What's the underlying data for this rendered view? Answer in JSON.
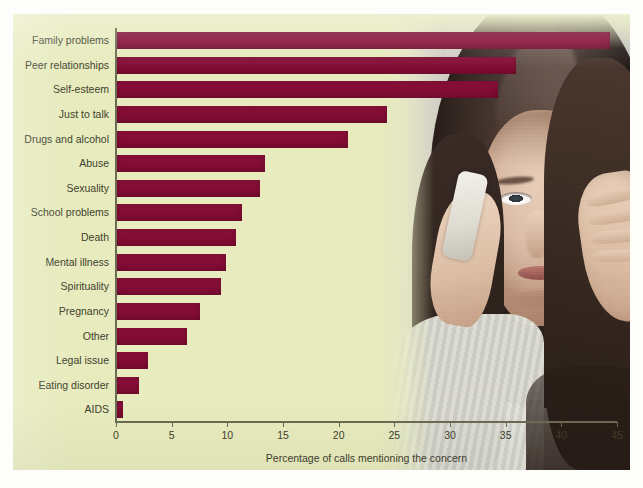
{
  "chart_data": {
    "type": "bar",
    "orientation": "horizontal",
    "title": "",
    "xlabel": "Percentage of calls mentioning the concern",
    "ylabel": "",
    "xlim": [
      0,
      45
    ],
    "xticks": [
      0,
      5,
      10,
      15,
      20,
      25,
      30,
      35,
      40,
      45
    ],
    "grid": false,
    "legend": null,
    "bar_color": "#8b1039",
    "background_color": "#e7ebbd",
    "categories": [
      "Family problems",
      "Peer relationships",
      "Self-esteem",
      "Just to talk",
      "Drugs and alcohol",
      "Abuse",
      "Sexuality",
      "School problems",
      "Death",
      "Mental illness",
      "Spirituality",
      "Pregnancy",
      "Other",
      "Legal issue",
      "Eating disorder",
      "AIDS"
    ],
    "values": [
      44.4,
      35.9,
      34.3,
      24.3,
      20.8,
      13.4,
      12.9,
      11.3,
      10.8,
      9.9,
      9.4,
      7.5,
      6.4,
      2.9,
      2.1,
      0.6
    ]
  },
  "figure": {
    "photo_caption": "young woman talking on a mobile phone with hand on temple"
  }
}
